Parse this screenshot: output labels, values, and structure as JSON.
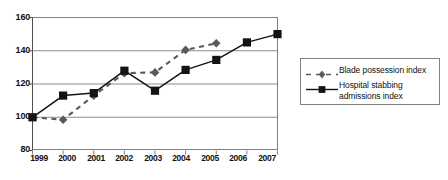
{
  "chart_data": {
    "type": "line",
    "title": "",
    "subtitle": "",
    "xlabel": "",
    "ylabel": "",
    "x": [
      1999,
      2000,
      2001,
      2002,
      2003,
      2004,
      2005,
      2006,
      2007
    ],
    "categories": [
      "1999",
      "2000",
      "2001",
      "2002",
      "2003",
      "2004",
      "2005",
      "2006",
      "2007"
    ],
    "xtick_labels": [
      "1999",
      "2000",
      "2001",
      "2002",
      "2003",
      "2004",
      "2005",
      "2006",
      "2007"
    ],
    "ytick_labels": [
      "80",
      "100",
      "120",
      "140",
      "160"
    ],
    "yticks": [
      80,
      100,
      120,
      140,
      160
    ],
    "ylim": [
      80,
      160
    ],
    "xlim": [
      1999,
      2007
    ],
    "grid": "horizontal",
    "legend_position": "right",
    "series": [
      {
        "name": "Blade possession index",
        "marker": "diamond",
        "linestyle": "dashed",
        "color": "#595959",
        "values": [
          100,
          98.5,
          113,
          126.5,
          127,
          140.5,
          144.5,
          null,
          null
        ]
      },
      {
        "name": "Hospital stabbing admissions index",
        "marker": "square",
        "linestyle": "solid",
        "color": "#141414",
        "values": [
          100,
          113,
          114.5,
          128,
          116,
          128.5,
          134.5,
          145,
          150
        ]
      }
    ]
  },
  "legend": {
    "entries": [
      {
        "label": "Blade possession index"
      },
      {
        "label": "Hospital stabbing\nadmissions index"
      }
    ]
  },
  "colors": {
    "blade_series": "#595959",
    "hospital_series": "#141414",
    "gridline": "#8c8c8c",
    "frame": "#808080",
    "background": "#ffffff",
    "text": "#111111"
  }
}
